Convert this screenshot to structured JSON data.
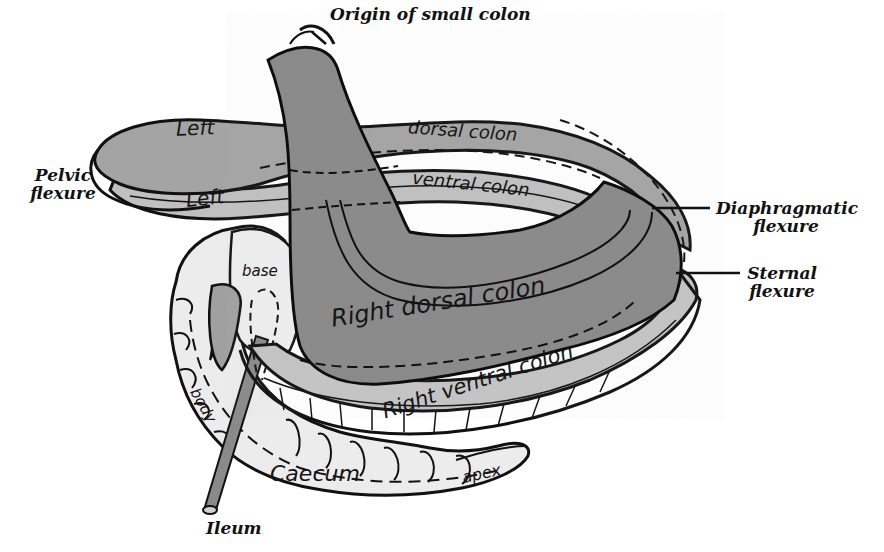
{
  "figure": {
    "type": "anatomical illustration",
    "colors": {
      "background": "#ffffff",
      "dark_gray": "#8a8a8a",
      "mid_gray": "#a6a6a6",
      "light_gray": "#c8c8c8",
      "pale": "#e8e8e8",
      "outline": "#111111"
    }
  },
  "labels": {
    "origin_small_colon": "Origin of small colon",
    "pelvic_flexure_1": "Pelvic",
    "pelvic_flexure_2": "flexure",
    "diaphragmatic_flexure_1": "Diaphragmatic",
    "diaphragmatic_flexure_2": "flexure",
    "sternal_flexure_1": "Sternal",
    "sternal_flexure_2": "flexure",
    "left_dorsal_1": "Left",
    "left_dorsal_2": "dorsal colon",
    "left_ventral_1": "Left",
    "left_ventral_2": "ventral colon",
    "right_dorsal_colon": "Right dorsal colon",
    "right_ventral_colon": "Right ventral colon",
    "base": "base",
    "body": "body",
    "caecum": "Caecum",
    "apex": "apex",
    "ileum": "Ileum"
  }
}
